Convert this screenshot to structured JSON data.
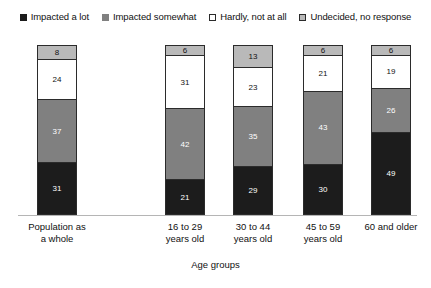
{
  "chart_data": {
    "type": "bar",
    "subtype": "stacked-bar",
    "title": "",
    "xlabel": "Age groups",
    "ylabel": "",
    "ylim": [
      0,
      100
    ],
    "grid": false,
    "legend_position": "top",
    "categories": [
      "Population as a whole",
      "16 to 29 years old",
      "30 to 44 years old",
      "45 to 59 years old",
      "60 and older"
    ],
    "category_lines": [
      [
        "Population as",
        "a whole"
      ],
      [
        "16 to 29",
        "years old"
      ],
      [
        "30 to 44",
        "years old"
      ],
      [
        "45 to 59",
        "years old"
      ],
      [
        "60 and older",
        ""
      ]
    ],
    "series": [
      {
        "name": "Impacted a lot",
        "color": "#1c1c1c",
        "values": [
          31,
          21,
          29,
          30,
          49
        ]
      },
      {
        "name": "Impacted somewhat",
        "color": "#808080",
        "values": [
          37,
          42,
          35,
          43,
          26
        ]
      },
      {
        "name": "Hardly, not at all",
        "color": "#ffffff",
        "values": [
          24,
          31,
          23,
          21,
          19
        ]
      },
      {
        "name": "Undecided, no response",
        "color": "#b9b9b9",
        "values": [
          8,
          6,
          13,
          6,
          6
        ]
      }
    ]
  },
  "legend": {
    "items": [
      {
        "label": "Impacted a lot",
        "swatch": "legend-swatch-impacted-a-lot",
        "color": "#1c1c1c"
      },
      {
        "label": "Impacted somewhat",
        "swatch": "legend-swatch-impacted-somewhat",
        "color": "#808080"
      },
      {
        "label": "Hardly, not at all",
        "swatch": "legend-swatch-hardly-not-at-all",
        "color": "#ffffff"
      },
      {
        "label": "Undecided, no response",
        "swatch": "legend-swatch-undecided-no-response",
        "color": "#b9b9b9"
      }
    ]
  },
  "axis": {
    "x_title": "Age groups"
  },
  "bars": [
    {
      "category_line1": "Population as",
      "category_line2": "a whole",
      "segments": [
        {
          "series": "Undecided, no response",
          "value": "8"
        },
        {
          "series": "Hardly, not at all",
          "value": "24"
        },
        {
          "series": "Impacted somewhat",
          "value": "37"
        },
        {
          "series": "Impacted a lot",
          "value": "31"
        }
      ]
    },
    {
      "category_line1": "16 to 29",
      "category_line2": "years old",
      "segments": [
        {
          "series": "Undecided, no response",
          "value": "6"
        },
        {
          "series": "Hardly, not at all",
          "value": "31"
        },
        {
          "series": "Impacted somewhat",
          "value": "42"
        },
        {
          "series": "Impacted a lot",
          "value": "21"
        }
      ]
    },
    {
      "category_line1": "30 to 44",
      "category_line2": "years old",
      "segments": [
        {
          "series": "Undecided, no response",
          "value": "13"
        },
        {
          "series": "Hardly, not at all",
          "value": "23"
        },
        {
          "series": "Impacted somewhat",
          "value": "35"
        },
        {
          "series": "Impacted a lot",
          "value": "29"
        }
      ]
    },
    {
      "category_line1": "45 to 59",
      "category_line2": "years old",
      "segments": [
        {
          "series": "Undecided, no response",
          "value": "6"
        },
        {
          "series": "Hardly, not at all",
          "value": "21"
        },
        {
          "series": "Impacted somewhat",
          "value": "43"
        },
        {
          "series": "Impacted a lot",
          "value": "30"
        }
      ]
    },
    {
      "category_line1": "60 and older",
      "category_line2": "",
      "segments": [
        {
          "series": "Undecided, no response",
          "value": "6"
        },
        {
          "series": "Hardly, not at all",
          "value": "19"
        },
        {
          "series": "Impacted somewhat",
          "value": "26"
        },
        {
          "series": "Impacted a lot",
          "value": "49"
        }
      ]
    }
  ]
}
